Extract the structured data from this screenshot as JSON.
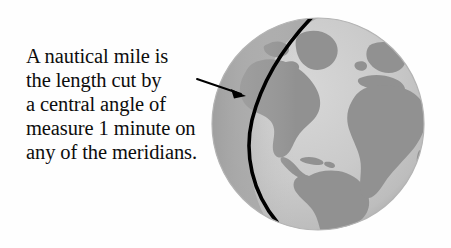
{
  "figure": {
    "background_color": "#fefefe",
    "width": 451,
    "height": 248
  },
  "caption": {
    "lines": [
      "A nautical mile is",
      "the length cut by",
      "a central angle of",
      "measure 1 minute on",
      "any of the meridians."
    ],
    "full_text": "A nautical mile is the length cut by a central angle of measure 1 minute on any of the meridians.",
    "text_color": "#0d0d0d"
  },
  "annotation": {
    "pointer_label": "arrow-to-meridian",
    "color": "#000000",
    "tail_x": 197,
    "tail_y": 79,
    "tip_x": 245,
    "tip_y": 95
  },
  "globe": {
    "label": "Earth globe",
    "center_x": 318,
    "center_y": 124,
    "radius": 106,
    "ocean_color": "#c9c9c9",
    "land_color": "#919191",
    "rim_color": "#a6a6a6",
    "shadow_color": "#9b9b9b",
    "highlight_color": "#d6d6d6",
    "meridian": {
      "label": "meridian-arc",
      "color": "#000000",
      "stroke_width": 3.6,
      "top_x": 313,
      "top_y": 16,
      "bottom_x": 277,
      "bottom_y": 222
    },
    "landmasses": [
      "North America",
      "Greenland",
      "South America",
      "Europe",
      "Africa"
    ]
  }
}
